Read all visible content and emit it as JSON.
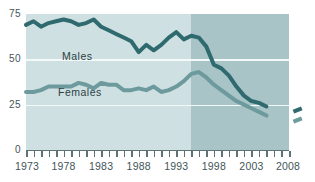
{
  "chart_data": {
    "type": "line",
    "title": "",
    "subtitle": "",
    "xlabel": "",
    "ylabel": "",
    "xlim": [
      1973,
      2008
    ],
    "ylim": [
      0,
      75
    ],
    "yticks": [
      0,
      25,
      50,
      75
    ],
    "ytick_labels": [
      "0",
      "25",
      "50",
      "75"
    ],
    "xticks": [
      1973,
      1978,
      1983,
      1988,
      1993,
      1998,
      2003,
      2008
    ],
    "xtick_labels": [
      "1973",
      "1978",
      "1983",
      "1988",
      "1993",
      "1998",
      "2003",
      "2008"
    ],
    "x_minor_tick_interval": 1,
    "grid": "horizontal-white",
    "legend_position": "inline-annotations",
    "x": [
      1973,
      1974,
      1975,
      1976,
      1977,
      1978,
      1979,
      1980,
      1981,
      1982,
      1983,
      1984,
      1985,
      1986,
      1987,
      1988,
      1989,
      1990,
      1991,
      1992,
      1993,
      1994,
      1995,
      1996,
      1997,
      1998,
      1999,
      2000,
      2001,
      2002,
      2003,
      2004,
      2005
    ],
    "series": [
      {
        "name": "Males",
        "color": "#2e6a6e",
        "values": [
          69,
          71,
          68,
          70,
          71,
          72,
          71,
          69,
          70,
          72,
          68,
          66,
          64,
          62,
          60,
          54,
          58,
          55,
          58,
          62,
          65,
          61,
          63,
          62,
          57,
          47,
          45,
          41,
          35,
          30,
          27,
          26,
          24
        ],
        "projection_values": [
          27,
          26,
          25,
          27,
          26
        ],
        "label_text": "Males"
      },
      {
        "name": "Females",
        "color": "#6d9a9d",
        "values": [
          32,
          32,
          33,
          35,
          35,
          35,
          35,
          37,
          36,
          34,
          37,
          36,
          36,
          33,
          33,
          34,
          33,
          35,
          32,
          33,
          35,
          38,
          42,
          43,
          40,
          36,
          33,
          30,
          27,
          25,
          23,
          21,
          19
        ],
        "projection_values": [
          21,
          20,
          19,
          18,
          17
        ],
        "label_text": "Females"
      }
    ],
    "band_split_year": 1995,
    "bands": [
      {
        "name": "historical",
        "from": 1973,
        "to": 1995,
        "color": "#cfe0e2"
      },
      {
        "name": "projected",
        "from": 1995,
        "to": 2008,
        "color": "#a8c4c7"
      }
    ],
    "colors": {
      "males_line": "#2e6a6e",
      "females_line": "#6d9a9d",
      "band_historical": "#cfe0e2",
      "band_projected": "#a8c4c7",
      "gridline": "#f3f8f8",
      "axis": "#5d7376",
      "tick_text": "#3f5558",
      "background": "#ffffff"
    }
  }
}
